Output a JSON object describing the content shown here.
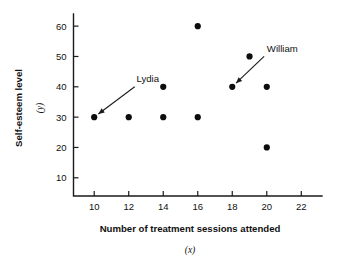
{
  "chart_data": {
    "type": "scatter",
    "title": "",
    "xlabel": "Number of treatment sessions attended",
    "xlabel_var": "(x)",
    "ylabel": "Self-esteem level",
    "ylabel_var": "(y)",
    "xlim": [
      8.8,
      23.2
    ],
    "ylim": [
      4,
      64
    ],
    "xticks": [
      10,
      12,
      14,
      16,
      18,
      20,
      22
    ],
    "xticklabels": [
      "10",
      "12",
      "14",
      "16",
      "18",
      "20",
      "22"
    ],
    "yticks": [
      10,
      20,
      30,
      40,
      50,
      60
    ],
    "yticklabels": [
      "10",
      "20",
      "30",
      "40",
      "50",
      "60"
    ],
    "grid": false,
    "legend": false,
    "marker": "filled-circle",
    "marker_color": "#0d0d0d",
    "points": [
      {
        "x": 10,
        "y": 30
      },
      {
        "x": 12,
        "y": 30
      },
      {
        "x": 14,
        "y": 30
      },
      {
        "x": 14,
        "y": 40
      },
      {
        "x": 16,
        "y": 30
      },
      {
        "x": 16,
        "y": 60
      },
      {
        "x": 18,
        "y": 40
      },
      {
        "x": 19,
        "y": 50
      },
      {
        "x": 20,
        "y": 40
      },
      {
        "x": 20,
        "y": 20
      }
    ],
    "annotations": [
      {
        "text": "Lydia",
        "label_x": 13.1,
        "label_y": 41.5,
        "target_x": 10,
        "target_y": 30
      },
      {
        "text": "William",
        "label_x": 20.9,
        "label_y": 51.5,
        "target_x": 18,
        "target_y": 40
      }
    ]
  }
}
